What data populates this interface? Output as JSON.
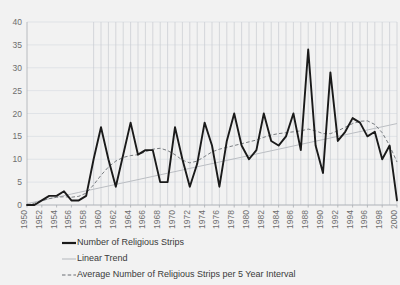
{
  "chart_data": {
    "type": "line",
    "title": "",
    "xlabel": "",
    "ylabel": "",
    "xlim": [
      1950,
      2000
    ],
    "ylim": [
      0,
      40
    ],
    "grid": "horizontal-and-vertical",
    "legend_position": "bottom-left",
    "y_ticks": [
      0,
      5,
      10,
      15,
      20,
      25,
      30,
      35,
      40
    ],
    "x_ticks": [
      1950,
      1952,
      1954,
      1956,
      1958,
      1960,
      1962,
      1964,
      1966,
      1968,
      1970,
      1972,
      1974,
      1976,
      1978,
      1980,
      1982,
      1984,
      1986,
      1988,
      1990,
      1992,
      1994,
      1996,
      1998,
      2000
    ],
    "x": [
      1950,
      1951,
      1952,
      1953,
      1954,
      1955,
      1956,
      1957,
      1958,
      1959,
      1960,
      1961,
      1962,
      1963,
      1964,
      1965,
      1966,
      1967,
      1968,
      1969,
      1970,
      1971,
      1972,
      1973,
      1974,
      1975,
      1976,
      1977,
      1978,
      1979,
      1980,
      1981,
      1982,
      1983,
      1984,
      1985,
      1986,
      1987,
      1988,
      1989,
      1990,
      1991,
      1992,
      1993,
      1994,
      1995,
      1996,
      1997,
      1998,
      1999,
      2000
    ],
    "series": [
      {
        "name": "Number of Religious Strips",
        "style": "solid",
        "color": "#1a1a1a",
        "values": [
          0,
          0,
          1,
          2,
          2,
          3,
          1,
          1,
          2,
          10,
          17,
          10,
          4,
          11,
          18,
          11,
          12,
          12,
          5,
          5,
          17,
          10,
          4,
          9,
          18,
          13,
          4,
          14,
          20,
          13,
          10,
          12,
          20,
          14,
          13,
          15,
          20,
          12,
          34,
          13,
          7,
          29,
          14,
          16,
          19,
          18,
          15,
          16,
          10,
          13,
          1
        ]
      },
      {
        "name": "Linear Trend",
        "style": "solid-light",
        "color": "#b4b8bd",
        "values": [
          0.3,
          0.65,
          1.0,
          1.35,
          1.7,
          2.05,
          2.4,
          2.75,
          3.1,
          3.45,
          3.8,
          4.15,
          4.5,
          4.85,
          5.2,
          5.55,
          5.9,
          6.25,
          6.6,
          6.95,
          7.3,
          7.65,
          8.0,
          8.35,
          8.7,
          9.05,
          9.4,
          9.75,
          10.1,
          10.45,
          10.8,
          11.15,
          11.5,
          11.85,
          12.2,
          12.55,
          12.9,
          13.25,
          13.6,
          13.95,
          14.3,
          14.65,
          15.0,
          15.35,
          15.7,
          16.05,
          16.4,
          16.75,
          17.1,
          17.45,
          17.8
        ]
      },
      {
        "name": "Average Number of Religious Strips per 5 Year Interval",
        "style": "dashed",
        "color": "#6b6f74",
        "values": [
          0,
          0.4,
          0.9,
          1.4,
          1.7,
          1.8,
          1.7,
          1.9,
          2.6,
          4.4,
          6.5,
          8.3,
          9.6,
          10.4,
          10.8,
          11.0,
          11.6,
          12.2,
          12.4,
          11.9,
          11.0,
          9.8,
          9.2,
          9.6,
          10.6,
          11.6,
          12.2,
          12.6,
          13.0,
          13.4,
          13.8,
          14.2,
          14.8,
          15.3,
          15.6,
          15.8,
          16.0,
          16.2,
          16.6,
          16.2,
          15.6,
          15.6,
          16.2,
          17.0,
          17.8,
          18.3,
          18.4,
          17.6,
          15.8,
          13.0,
          9.4
        ]
      }
    ]
  },
  "legend": {
    "items": [
      {
        "label": "Number of Religious Strips",
        "marker": "solid-thick-line"
      },
      {
        "label": "Linear Trend",
        "marker": "solid-thin-line"
      },
      {
        "label": "Average Number of Religious Strips per 5 Year Interval",
        "marker": "dashed-line"
      }
    ]
  }
}
